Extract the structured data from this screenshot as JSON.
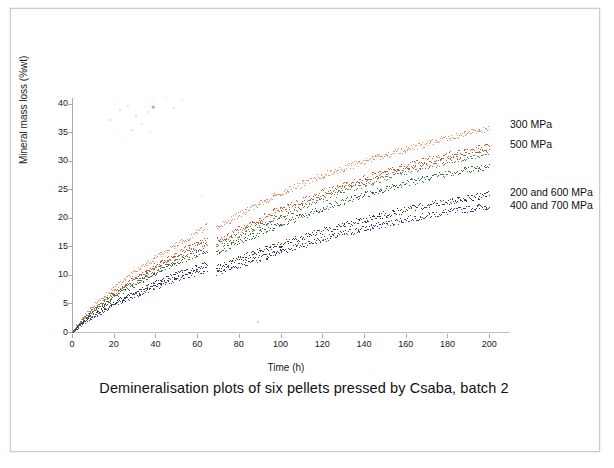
{
  "figure": {
    "caption": "Demineralisation plots of six pellets pressed by Csaba, batch 2",
    "border_color": "#c9cbdd",
    "background": "#ffffff"
  },
  "chart_data": {
    "type": "scatter",
    "title": "",
    "subtitle": "",
    "xlabel": "Time (h)",
    "ylabel": "Mineral mass loss (%wt)",
    "xlim": [
      0,
      210
    ],
    "ylim": [
      0,
      41
    ],
    "xticks": [
      0,
      20,
      40,
      60,
      80,
      100,
      120,
      140,
      160,
      180,
      200
    ],
    "yticks": [
      0,
      5,
      10,
      15,
      20,
      25,
      30,
      35,
      40
    ],
    "grid": false,
    "legend_position": "right-inline-labels",
    "marker": "dot",
    "noise_amplitude_pct": 0.55,
    "discontinuity_hours": 65,
    "discontinuity_drop_pct": 1.2,
    "annotations": [
      {
        "text": "300 MPa",
        "at_x": 200,
        "at_y": 36.5
      },
      {
        "text": "500 MPa",
        "at_x": 200,
        "at_y": 33.0
      },
      {
        "text": "200 and 600 MPa",
        "at_x": 200,
        "at_y": 24.5
      },
      {
        "text": "400 and 700 MPa",
        "at_x": 200,
        "at_y": 22.3
      }
    ],
    "series": [
      {
        "name": "300 MPa",
        "label": "300 MPa",
        "color": "#e8906a",
        "x": [
          0,
          5,
          10,
          20,
          30,
          40,
          50,
          60,
          65,
          70,
          80,
          100,
          120,
          140,
          160,
          180,
          200
        ],
        "values": [
          0.0,
          2.6,
          4.6,
          7.8,
          10.6,
          13.1,
          15.4,
          17.6,
          18.6,
          19.6,
          21.9,
          25.6,
          28.6,
          31.1,
          33.2,
          35.1,
          36.8
        ]
      },
      {
        "name": "500 MPa",
        "label": "500 MPa",
        "color": "#d9542e",
        "x": [
          0,
          5,
          10,
          20,
          30,
          40,
          50,
          60,
          65,
          70,
          80,
          100,
          120,
          140,
          160,
          180,
          200
        ],
        "values": [
          0.0,
          2.3,
          4.1,
          7.0,
          9.5,
          11.7,
          13.7,
          15.6,
          16.5,
          17.3,
          19.3,
          22.8,
          25.7,
          28.1,
          30.3,
          32.1,
          33.6
        ]
      },
      {
        "name": "unlabelled upper-middle",
        "label": "",
        "color": "#6f7a52",
        "x": [
          0,
          5,
          10,
          20,
          30,
          40,
          50,
          60,
          65,
          70,
          80,
          100,
          120,
          140,
          160,
          180,
          200
        ],
        "values": [
          0.0,
          2.2,
          3.9,
          6.6,
          9.0,
          11.1,
          13.0,
          14.8,
          15.6,
          16.4,
          18.4,
          21.7,
          24.6,
          27.1,
          29.3,
          31.1,
          32.6
        ]
      },
      {
        "name": "unlabelled middle",
        "label": "",
        "color": "#3f6b3f",
        "x": [
          0,
          5,
          10,
          20,
          30,
          40,
          50,
          60,
          65,
          70,
          80,
          100,
          120,
          140,
          160,
          180,
          200
        ],
        "values": [
          0.0,
          2.0,
          3.6,
          6.2,
          8.4,
          10.4,
          12.2,
          13.8,
          14.6,
          15.3,
          17.1,
          20.2,
          22.9,
          25.2,
          27.3,
          28.9,
          30.2
        ]
      },
      {
        "name": "200 and 600 MPa",
        "label": "200 and 600 MPa",
        "color": "#3c3c3c",
        "x": [
          0,
          5,
          10,
          20,
          30,
          40,
          50,
          60,
          65,
          70,
          80,
          100,
          120,
          140,
          160,
          180,
          200
        ],
        "values": [
          0.0,
          1.7,
          3.0,
          5.2,
          7.0,
          8.6,
          10.1,
          11.4,
          12.0,
          12.6,
          14.1,
          16.7,
          18.9,
          20.9,
          22.6,
          24.0,
          25.2
        ]
      },
      {
        "name": "400 and 700 MPa",
        "label": "400 and 700 MPa",
        "color": "#3a3f82",
        "x": [
          0,
          5,
          10,
          20,
          30,
          40,
          50,
          60,
          65,
          70,
          80,
          100,
          120,
          140,
          160,
          180,
          200
        ],
        "values": [
          0.0,
          1.6,
          2.8,
          4.8,
          6.5,
          8.0,
          9.3,
          10.5,
          11.1,
          11.6,
          13.0,
          15.4,
          17.5,
          19.3,
          20.9,
          22.2,
          23.2
        ]
      }
    ]
  }
}
